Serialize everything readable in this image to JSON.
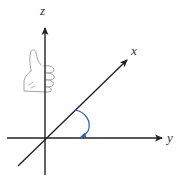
{
  "diagram": {
    "type": "3d-coordinate-axes-right-hand-rule",
    "axes": [
      {
        "name": "z",
        "label": "z",
        "direction": "up"
      },
      {
        "name": "x",
        "label": "x",
        "direction": "upper-right diagonal"
      },
      {
        "name": "y",
        "label": "y",
        "direction": "right"
      }
    ],
    "icons": {
      "hand": "thumbs-up-hand-icon",
      "rotation_arc": "curved-arrow-icon"
    },
    "colors": {
      "axis": "#222222",
      "arc": "#2a5fb0",
      "hand_outline": "#888888",
      "background": "#ffffff"
    }
  }
}
